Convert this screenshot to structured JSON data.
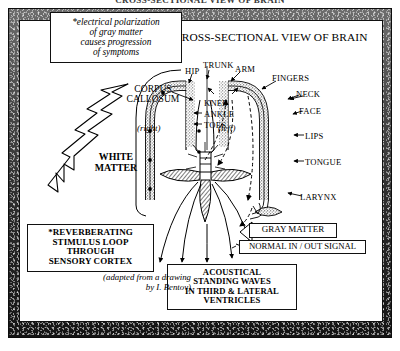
{
  "figure": {
    "top_title": "CROSS-SECTIONAL VIEW OF BRAIN",
    "heading_line1": "CROSS-SECTIONAL VIEW",
    "heading_line2": "OF BRAIN"
  },
  "callouts": {
    "electrical": {
      "line1": "*electrical polarization",
      "line2": "of gray matter",
      "line3": "causes progression",
      "line4": "of symptoms"
    },
    "reverberating": {
      "line1": "*REVERBERATING",
      "line2": "STIMULUS LOOP",
      "line3": "THROUGH",
      "line4": "SENSORY CORTEX"
    },
    "acoustical": {
      "line1": "ACOUSTICAL",
      "line2": "STANDING WAVES",
      "line3": "IN THIRD & LATERAL",
      "line4": "VENTRICLES"
    },
    "attribution": {
      "line1": "(adapted from",
      "line2": "a drawing by",
      "line3": "I. Bentov)"
    }
  },
  "legend": {
    "gray_matter": "GRAY MATTER",
    "normal_signal": "NORMAL IN / OUT SIGNAL"
  },
  "anatomy": {
    "corpus_line1": "CORPUS",
    "corpus_line2": "CALLOSUM",
    "white_line1": "WHITE",
    "white_line2": "MATTER",
    "hemisphere_right": "(right)",
    "hemisphere_left": "(left)"
  },
  "homunculus": {
    "outer": [
      "HIP",
      "TRUNK",
      "ARM",
      "FINGERS",
      "NECK",
      "FACE",
      "LIPS",
      "TONGUE",
      "LARYNX"
    ],
    "inner": [
      "KNEE",
      "ANKLE",
      "TOES"
    ],
    "hip": "HIP",
    "trunk": "TRUNK",
    "arm": "ARM",
    "fingers": "FINGERS",
    "neck": "NECK",
    "face": "FACE",
    "lips": "LIPS",
    "tongue": "TONGUE",
    "larynx": "LARYNX",
    "knee": "KNEE",
    "ankle": "ANKLE",
    "toes": "TOES"
  },
  "colors": {
    "ink": "#000000",
    "paper": "#ffffff",
    "frame_dark": "#1a1a1a",
    "stipple": "#8a8a8a"
  }
}
